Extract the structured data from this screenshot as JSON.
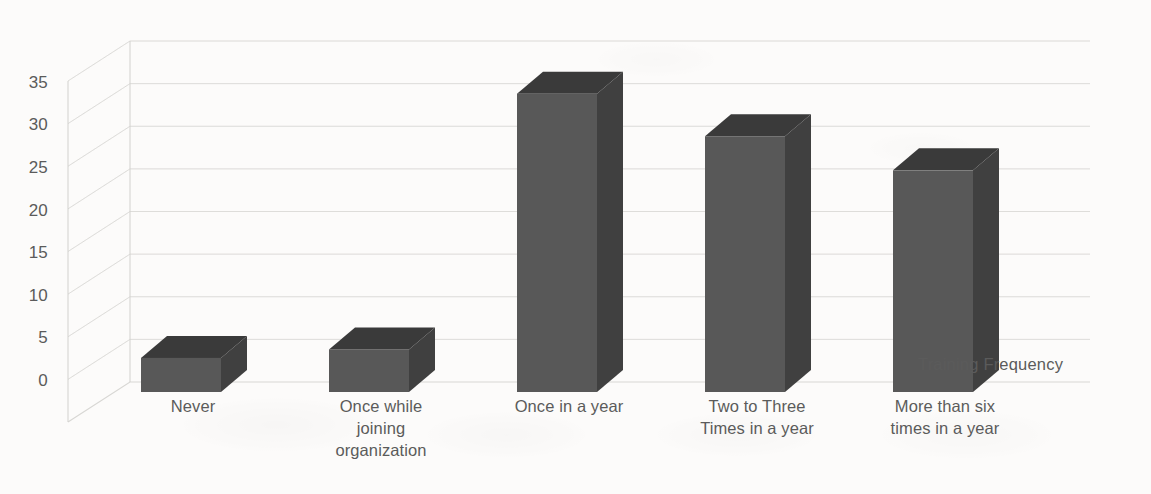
{
  "chart_data": {
    "type": "bar",
    "subtype": "3d-column",
    "title": "",
    "xlabel": "",
    "ylabel": "",
    "categories": [
      "Never",
      "Once while joining organization",
      "Once in a year",
      "Two to Three Times in a year",
      "More than six times in a year"
    ],
    "category_lines": [
      [
        "Never"
      ],
      [
        "Once while",
        "joining",
        "organization"
      ],
      [
        "Once in a year"
      ],
      [
        "Two to Three",
        "Times in a year"
      ],
      [
        "More than six",
        "times in a year"
      ]
    ],
    "series": [
      {
        "name": "Training Frequency",
        "values": [
          4,
          5,
          35,
          30,
          26
        ]
      }
    ],
    "ylim": [
      0,
      40
    ],
    "ytick_step": 5,
    "yticks": [
      0,
      5,
      10,
      15,
      20,
      25,
      30,
      35
    ],
    "ytick_labels": [
      "0",
      "5",
      "10",
      "15",
      "20",
      "25",
      "30",
      "35"
    ],
    "gridlines": true,
    "grid_axis": "y",
    "legend": {
      "visible": true,
      "position": "right",
      "entries": [
        "Training Frequency"
      ]
    }
  },
  "colors": {
    "background": "#fcfbfa",
    "bar_front": "#585858",
    "bar_side": "#404040",
    "bar_top": "#3a3a3a",
    "gridline": "#d8d7d4",
    "axis_line": "#d2d1ce",
    "text": "#5b5b5b"
  },
  "legend": {
    "series_label": "Training Frequency"
  }
}
